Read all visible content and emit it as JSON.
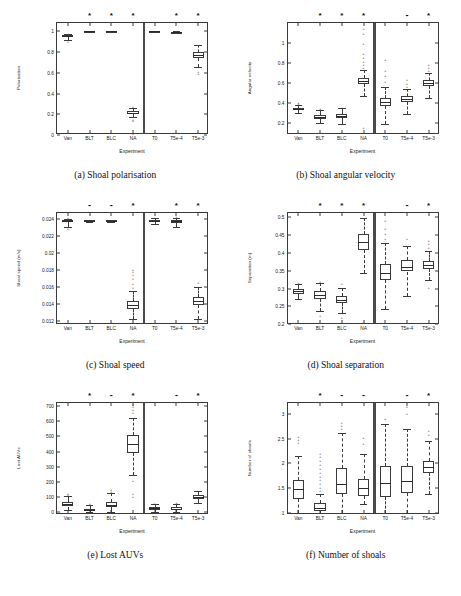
{
  "figure": {
    "xaxis_label": "Experiment",
    "categories": [
      "Van",
      "BLT",
      "BLC",
      "NA",
      "T0",
      "T5e-4",
      "T5e-3"
    ],
    "divider_after_index": 3,
    "significance_legend": {
      "significant": "*",
      "not_significant": "-"
    }
  },
  "panels": [
    {
      "key": "a",
      "caption": "(a) Shoal polarisation",
      "ylabel": "Polarisation",
      "yticks": [
        "0",
        "0.2",
        "0.4",
        "0.6",
        "0.8",
        "1"
      ],
      "ylim": [
        0,
        1.08
      ],
      "significance": [
        "",
        "*",
        "*",
        "*",
        "",
        "*",
        "*"
      ],
      "chart_data": {
        "type": "box",
        "title": "Shoal polarisation",
        "xlabel": "Experiment",
        "ylabel": "Polarisation",
        "categories": [
          "Van",
          "BLT",
          "BLC",
          "NA",
          "T0",
          "T5e-4",
          "T5e-3"
        ],
        "ylim": [
          0,
          1.08
        ],
        "grid": false,
        "boxes": [
          {
            "name": "Van",
            "whisker_low": 0.92,
            "q1": 0.945,
            "median": 0.953,
            "q3": 0.962,
            "whisker_high": 0.978,
            "outliers": [
              0.905,
              0.985
            ]
          },
          {
            "name": "BLT",
            "whisker_low": 0.998,
            "q1": 0.999,
            "median": 1.0,
            "q3": 1.0,
            "whisker_high": 1.0,
            "outliers": []
          },
          {
            "name": "BLC",
            "whisker_low": 0.998,
            "q1": 0.999,
            "median": 1.0,
            "q3": 1.0,
            "whisker_high": 1.0,
            "outliers": []
          },
          {
            "name": "NA",
            "whisker_low": 0.17,
            "q1": 0.205,
            "median": 0.216,
            "q3": 0.228,
            "whisker_high": 0.26,
            "outliers": [
              0.15,
              0.14,
              0.275,
              0.02
            ]
          },
          {
            "name": "T0",
            "whisker_low": 0.996,
            "q1": 0.999,
            "median": 1.0,
            "q3": 1.0,
            "whisker_high": 1.0,
            "outliers": []
          },
          {
            "name": "T5e-4",
            "whisker_low": 0.982,
            "q1": 0.99,
            "median": 0.993,
            "q3": 0.996,
            "whisker_high": 1.0,
            "outliers": []
          },
          {
            "name": "T5e-3",
            "whisker_low": 0.66,
            "q1": 0.745,
            "median": 0.775,
            "q3": 0.805,
            "whisker_high": 0.87,
            "outliers": [
              0.62,
              0.6
            ]
          }
        ]
      }
    },
    {
      "key": "b",
      "caption": "(b) Shoal angular velocity",
      "ylabel": "Angular velocity",
      "yticks": [
        "0.2",
        "0.4",
        "0.6",
        "0.8",
        "1"
      ],
      "ylim": [
        0.08,
        1.2
      ],
      "significance": [
        "",
        "*",
        "*",
        "*",
        "",
        "-",
        "*"
      ],
      "chart_data": {
        "type": "box",
        "title": "Shoal angular velocity",
        "xlabel": "Experiment",
        "ylabel": "Angular velocity",
        "categories": [
          "Van",
          "BLT",
          "BLC",
          "NA",
          "T0",
          "T5e-4",
          "T5e-3"
        ],
        "ylim": [
          0.08,
          1.2
        ],
        "grid": false,
        "boxes": [
          {
            "name": "Van",
            "whisker_low": 0.305,
            "q1": 0.33,
            "median": 0.342,
            "q3": 0.353,
            "whisker_high": 0.385,
            "outliers": [
              0.4,
              0.41
            ]
          },
          {
            "name": "BLT",
            "whisker_low": 0.205,
            "q1": 0.245,
            "median": 0.262,
            "q3": 0.28,
            "whisker_high": 0.33,
            "outliers": [
              0.345,
              0.355
            ]
          },
          {
            "name": "BLC",
            "whisker_low": 0.195,
            "q1": 0.255,
            "median": 0.272,
            "q3": 0.295,
            "whisker_high": 0.35,
            "outliers": [
              0.36
            ]
          },
          {
            "name": "NA",
            "whisker_low": 0.47,
            "q1": 0.59,
            "median": 0.62,
            "q3": 0.65,
            "whisker_high": 0.73,
            "outliers": [
              0.76,
              0.79,
              0.82,
              0.86,
              0.9,
              1.0,
              1.1,
              1.15,
              0.16
            ]
          },
          {
            "name": "T0",
            "whisker_low": 0.195,
            "q1": 0.37,
            "median": 0.41,
            "q3": 0.45,
            "whisker_high": 0.56,
            "outliers": [
              0.62,
              0.68,
              0.73,
              0.84
            ]
          },
          {
            "name": "T5e-4",
            "whisker_low": 0.29,
            "q1": 0.415,
            "median": 0.44,
            "q3": 0.47,
            "whisker_high": 0.54,
            "outliers": [
              0.57,
              0.6,
              0.64
            ]
          },
          {
            "name": "T5e-3",
            "whisker_low": 0.455,
            "q1": 0.575,
            "median": 0.605,
            "q3": 0.635,
            "whisker_high": 0.7,
            "outliers": [
              0.73,
              0.76,
              0.79
            ]
          }
        ]
      }
    },
    {
      "key": "c",
      "caption": "(c) Shoal speed",
      "ylabel": "Shoal speed (m/s)",
      "yticks": [
        "0.012",
        "0.014",
        "0.016",
        "0.018",
        "0.02",
        "0.022",
        "0.024"
      ],
      "ylim": [
        0.0115,
        0.0247
      ],
      "significance": [
        "",
        "-",
        "-",
        "*",
        "",
        "*",
        "*"
      ],
      "chart_data": {
        "type": "box",
        "title": "Shoal speed",
        "xlabel": "Experiment",
        "ylabel": "Shoal speed (m/s)",
        "categories": [
          "Van",
          "BLT",
          "BLC",
          "NA",
          "T0",
          "T5e-4",
          "T5e-3"
        ],
        "ylim": [
          0.0115,
          0.0247
        ],
        "grid": false,
        "boxes": [
          {
            "name": "Van",
            "whisker_low": 0.02305,
            "q1": 0.0236,
            "median": 0.02375,
            "q3": 0.02385,
            "whisker_high": 0.02405,
            "outliers": [
              0.0229,
              0.0242
            ]
          },
          {
            "name": "BLT",
            "whisker_low": 0.02365,
            "q1": 0.02375,
            "median": 0.02378,
            "q3": 0.02382,
            "whisker_high": 0.0239,
            "outliers": []
          },
          {
            "name": "BLC",
            "whisker_low": 0.02365,
            "q1": 0.02375,
            "median": 0.02378,
            "q3": 0.02382,
            "whisker_high": 0.0239,
            "outliers": []
          },
          {
            "name": "NA",
            "whisker_low": 0.01215,
            "q1": 0.0134,
            "median": 0.01385,
            "q3": 0.0143,
            "whisker_high": 0.01545,
            "outliers": [
              0.016,
              0.0165,
              0.017,
              0.0175,
              0.0179,
              0.0181
            ]
          },
          {
            "name": "T0",
            "whisker_low": 0.0234,
            "q1": 0.0237,
            "median": 0.0238,
            "q3": 0.02388,
            "whisker_high": 0.02408,
            "outliers": [
              0.0242
            ]
          },
          {
            "name": "T5e-4",
            "whisker_low": 0.023,
            "q1": 0.02355,
            "median": 0.0237,
            "q3": 0.02385,
            "whisker_high": 0.02415,
            "outliers": [
              0.0243
            ]
          },
          {
            "name": "T5e-3",
            "whisker_low": 0.01215,
            "q1": 0.0139,
            "median": 0.0143,
            "q3": 0.0148,
            "whisker_high": 0.016,
            "outliers": [
              0.01655
            ]
          }
        ]
      }
    },
    {
      "key": "d",
      "caption": "(d) Shoal separation",
      "ylabel": "Separation (m)",
      "yticks": [
        "0.2",
        "0.25",
        "0.3",
        "0.35",
        "0.4",
        "0.45",
        "0.5"
      ],
      "ylim": [
        0.198,
        0.512
      ],
      "significance": [
        "",
        "*",
        "*",
        "*",
        "",
        "-",
        "*"
      ],
      "chart_data": {
        "type": "box",
        "title": "Shoal separation",
        "xlabel": "Experiment",
        "ylabel": "Separation (m)",
        "categories": [
          "Van",
          "BLT",
          "BLC",
          "NA",
          "T0",
          "T5e-4",
          "T5e-3"
        ],
        "ylim": [
          0.198,
          0.512
        ],
        "grid": false,
        "boxes": [
          {
            "name": "Van",
            "whisker_low": 0.272,
            "q1": 0.286,
            "median": 0.292,
            "q3": 0.298,
            "whisker_high": 0.312,
            "outliers": [
              0.318
            ]
          },
          {
            "name": "BLT",
            "whisker_low": 0.238,
            "q1": 0.272,
            "median": 0.281,
            "q3": 0.292,
            "whisker_high": 0.315,
            "outliers": [
              0.225,
              0.322
            ]
          },
          {
            "name": "BLC",
            "whisker_low": 0.232,
            "q1": 0.261,
            "median": 0.269,
            "q3": 0.279,
            "whisker_high": 0.303,
            "outliers": [
              0.221,
              0.316
            ]
          },
          {
            "name": "NA",
            "whisker_low": 0.343,
            "q1": 0.408,
            "median": 0.432,
            "q3": 0.453,
            "whisker_high": 0.497,
            "outliers": []
          },
          {
            "name": "T0",
            "whisker_low": 0.243,
            "q1": 0.325,
            "median": 0.345,
            "q3": 0.368,
            "whisker_high": 0.428,
            "outliers": [
              0.442,
              0.455,
              0.47,
              0.492
            ]
          },
          {
            "name": "T5e-4",
            "whisker_low": 0.278,
            "q1": 0.348,
            "median": 0.362,
            "q3": 0.379,
            "whisker_high": 0.42,
            "outliers": [
              0.443
            ]
          },
          {
            "name": "T5e-3",
            "whisker_low": 0.325,
            "q1": 0.355,
            "median": 0.366,
            "q3": 0.378,
            "whisker_high": 0.405,
            "outliers": [
              0.418,
              0.428,
              0.437,
              0.305
            ]
          }
        ]
      }
    },
    {
      "key": "e",
      "caption": "(e) Lost AUVs",
      "ylabel": "Lost AUVs",
      "yticks": [
        "0",
        "100",
        "200",
        "300",
        "400",
        "500",
        "600",
        "700"
      ],
      "ylim": [
        -18,
        720
      ],
      "significance": [
        "",
        "*",
        "-",
        "*",
        "",
        "-",
        "*"
      ],
      "chart_data": {
        "type": "box",
        "title": "Lost AUVs",
        "xlabel": "Experiment",
        "ylabel": "Lost AUVs",
        "categories": [
          "Van",
          "BLT",
          "BLC",
          "NA",
          "T0",
          "T5e-4",
          "T5e-3"
        ],
        "ylim": [
          -18,
          720
        ],
        "grid": false,
        "boxes": [
          {
            "name": "Van",
            "whisker_low": 12,
            "q1": 38,
            "median": 52,
            "q3": 68,
            "whisker_high": 108,
            "outliers": [
              120,
              128
            ]
          },
          {
            "name": "BLT",
            "whisker_low": 0,
            "q1": 8,
            "median": 14,
            "q3": 24,
            "whisker_high": 45,
            "outliers": [
              56,
              62
            ]
          },
          {
            "name": "BLC",
            "whisker_low": 5,
            "q1": 32,
            "median": 48,
            "q3": 70,
            "whisker_high": 125,
            "outliers": [
              140,
              155
            ]
          },
          {
            "name": "NA",
            "whisker_low": 245,
            "q1": 390,
            "median": 448,
            "q3": 510,
            "whisker_high": 620,
            "outliers": [
              660,
              680,
              700,
              715,
              215,
              125,
              110
            ]
          },
          {
            "name": "T0",
            "whisker_low": 4,
            "q1": 18,
            "median": 26,
            "q3": 34,
            "whisker_high": 52,
            "outliers": [
              58,
              64
            ]
          },
          {
            "name": "T5e-4",
            "whisker_low": 2,
            "q1": 16,
            "median": 24,
            "q3": 34,
            "whisker_high": 56,
            "outliers": [
              62,
              68
            ]
          },
          {
            "name": "T5e-3",
            "whisker_low": 62,
            "q1": 86,
            "median": 98,
            "q3": 112,
            "whisker_high": 142,
            "outliers": []
          }
        ]
      }
    },
    {
      "key": "f",
      "caption": "(f) Number of shoals",
      "ylabel": "Number of shoals",
      "yticks": [
        "1",
        "1.5",
        "2",
        "2.5",
        "3"
      ],
      "ylim": [
        0.95,
        3.22
      ],
      "significance": [
        "",
        "*",
        "-",
        "-",
        "",
        "-",
        "*"
      ],
      "chart_data": {
        "type": "box",
        "title": "Number of shoals",
        "xlabel": "Experiment",
        "ylabel": "Number of shoals",
        "categories": [
          "Van",
          "BLT",
          "BLC",
          "NA",
          "T0",
          "T5e-4",
          "T5e-3"
        ],
        "ylim": [
          0.95,
          3.22
        ],
        "grid": false,
        "boxes": [
          {
            "name": "Van",
            "whisker_low": 1.0,
            "q1": 1.28,
            "median": 1.47,
            "q3": 1.66,
            "whisker_high": 2.15,
            "outliers": [
              2.43,
              2.5,
              2.56
            ]
          },
          {
            "name": "BLT",
            "whisker_low": 1.0,
            "q1": 1.03,
            "median": 1.09,
            "q3": 1.19,
            "whisker_high": 1.38,
            "outliers": [
              1.45,
              1.52,
              1.6,
              1.68,
              1.75,
              1.82,
              1.9,
              1.98,
              2.06,
              2.14,
              2.2
            ]
          },
          {
            "name": "BLC",
            "whisker_low": 1.0,
            "q1": 1.38,
            "median": 1.57,
            "q3": 1.9,
            "whisker_high": 2.62,
            "outliers": [
              2.72,
              2.78,
              2.84
            ]
          },
          {
            "name": "NA",
            "whisker_low": 1.17,
            "q1": 1.33,
            "median": 1.49,
            "q3": 1.68,
            "whisker_high": 2.18,
            "outliers": [
              2.4,
              2.53
            ]
          },
          {
            "name": "T0",
            "whisker_low": 1.0,
            "q1": 1.31,
            "median": 1.6,
            "q3": 1.94,
            "whisker_high": 2.8,
            "outliers": [
              2.92
            ]
          },
          {
            "name": "T5e-4",
            "whisker_low": 1.0,
            "q1": 1.4,
            "median": 1.63,
            "q3": 1.94,
            "whisker_high": 2.7,
            "outliers": [
              3.02,
              3.15
            ]
          },
          {
            "name": "T5e-3",
            "whisker_low": 1.37,
            "q1": 1.8,
            "median": 1.92,
            "q3": 2.05,
            "whisker_high": 2.45,
            "outliers": [
              2.6,
              2.68
            ]
          }
        ]
      }
    }
  ]
}
